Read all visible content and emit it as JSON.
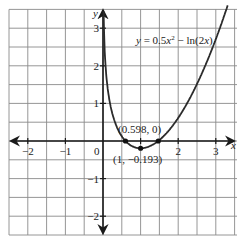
{
  "chart_data": {
    "type": "line",
    "title": "",
    "function_label": "y = 0.5x² − ln(2x)",
    "function_label_parts": {
      "lhs": "y",
      "eq": " = 0.5",
      "x": "x",
      "exp": "2",
      "minus": " − ln(2",
      "x2": "x",
      "close": ")"
    },
    "xlabel": "x",
    "ylabel": "y",
    "xlim": [
      -2.5,
      3.5
    ],
    "ylim": [
      -2.5,
      3.5
    ],
    "grid": true,
    "grid_step": 0.5,
    "x_ticks": [
      -2,
      -1,
      0,
      1,
      2,
      3
    ],
    "x_tick_labels": [
      "−2",
      "−1",
      "0",
      "",
      "2",
      "3"
    ],
    "y_ticks": [
      -2,
      -1,
      1,
      2,
      3
    ],
    "y_tick_labels": [
      "−2",
      "−1",
      "1",
      "2",
      "3"
    ],
    "origin_label": "0",
    "series": [
      {
        "name": "y = 0.5x² − ln(2x)",
        "x": [
          0.016,
          0.02,
          0.03,
          0.05,
          0.075,
          0.1,
          0.15,
          0.2,
          0.3,
          0.4,
          0.5,
          0.598,
          0.7,
          0.85,
          1.0,
          1.2,
          1.4,
          1.47,
          1.6,
          1.75,
          2.0,
          2.25,
          2.5,
          2.75,
          3.0,
          3.25,
          3.32
        ],
        "y": [
          3.43,
          3.219,
          2.814,
          2.304,
          1.899,
          1.614,
          1.215,
          0.936,
          0.556,
          0.303,
          0.125,
          0.0,
          -0.091,
          -0.17,
          -0.193,
          -0.155,
          -0.05,
          0.0,
          0.117,
          0.278,
          0.614,
          1.027,
          1.516,
          2.076,
          2.708,
          3.409,
          3.617
        ]
      }
    ],
    "annotations": [
      {
        "label": "(0.598, 0)",
        "x": 0.598,
        "y": 0
      },
      {
        "label": "(1, −0.193)",
        "x": 1,
        "y": -0.193
      }
    ],
    "points": [
      {
        "x": 0.598,
        "y": 0
      },
      {
        "x": 1,
        "y": -0.193
      },
      {
        "x": 1.47,
        "y": 0
      }
    ]
  }
}
